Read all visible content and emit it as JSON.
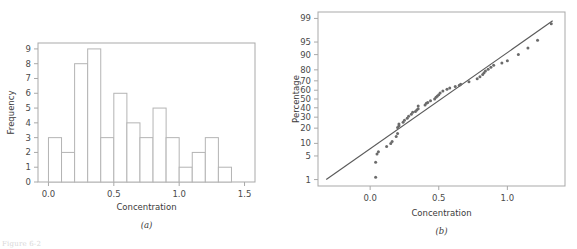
{
  "figure": {
    "background": "#ffffff",
    "ink_color": "#3f3f3f",
    "bar_stroke": "#b4b4b4",
    "line_color": "#5a5a5a",
    "point_color": "#6b6b6b",
    "axis_color": "#a9a9a9",
    "footnote": "Figure 6-2"
  },
  "panel_a": {
    "caption": "(a)",
    "xlabel": "Concentration",
    "ylabel": "Frequency"
  },
  "panel_b": {
    "caption": "(b)",
    "xlabel": "Concentration",
    "ylabel": "Percentage"
  },
  "chart_data": [
    {
      "type": "bar",
      "id": "panel-a-histogram",
      "title": "",
      "subtitle": "",
      "xlabel": "Concentration",
      "ylabel": "Frequency",
      "caption": "(a)",
      "xlim": [
        -0.08,
        1.58
      ],
      "ylim": [
        0,
        9.4
      ],
      "grid": false,
      "legend": null,
      "xticks": [
        0.0,
        0.5,
        1.0,
        1.5
      ],
      "xticklabels": [
        "0.0",
        "0.5",
        "1.0",
        "1.5"
      ],
      "yticks": [
        0,
        1,
        2,
        3,
        4,
        5,
        6,
        7,
        8,
        9
      ],
      "yticklabels": [
        "0",
        "1",
        "2",
        "3",
        "4",
        "5",
        "6",
        "7",
        "8",
        "9"
      ],
      "bin_width": 0.1,
      "bin_edges": [
        0.0,
        0.1,
        0.2,
        0.3,
        0.4,
        0.5,
        0.6,
        0.7,
        0.8,
        0.9,
        1.0,
        1.1,
        1.2,
        1.3
      ],
      "categories": [
        "0.0-0.1",
        "0.1-0.2",
        "0.2-0.3",
        "0.3-0.4",
        "0.4-0.5",
        "0.5-0.6",
        "0.6-0.7",
        "0.7-0.8",
        "0.8-0.9",
        "0.9-1.0",
        "1.0-1.1",
        "1.1-1.2",
        "1.2-1.3"
      ],
      "values": [
        3,
        2,
        8,
        9,
        3,
        6,
        4,
        3,
        5,
        3,
        1,
        2,
        3,
        1
      ],
      "bar_heights": [
        3,
        2,
        8,
        9,
        3,
        6,
        4,
        3,
        5,
        3,
        1,
        2,
        3,
        1
      ]
    },
    {
      "type": "scatter",
      "id": "panel-b-normal-probability-plot",
      "title": "",
      "subtitle": "",
      "xlabel": "Concentration",
      "ylabel": "Percentage",
      "caption": "(b)",
      "xlim": [
        -0.38,
        1.42
      ],
      "xticks": [
        0.0,
        0.5,
        1.0
      ],
      "xticklabels": [
        "0.0",
        "0.5",
        "1.0"
      ],
      "y_scale": "normal-probability",
      "yticks": [
        1,
        5,
        10,
        20,
        30,
        40,
        50,
        60,
        70,
        80,
        90,
        95,
        99
      ],
      "yticklabels": [
        "1",
        "5",
        "10",
        "20",
        "30",
        "40",
        "50",
        "60",
        "70",
        "80",
        "90",
        "95",
        "99"
      ],
      "grid": false,
      "legend": null,
      "reference_line": {
        "label": "normal fit line",
        "x_start": -0.32,
        "y_start": 1.0,
        "x_end": 1.33,
        "y_end": 98.8
      },
      "x": [
        0.04,
        0.04,
        0.05,
        0.06,
        0.12,
        0.15,
        0.16,
        0.19,
        0.2,
        0.2,
        0.21,
        0.21,
        0.24,
        0.25,
        0.27,
        0.28,
        0.3,
        0.31,
        0.33,
        0.34,
        0.35,
        0.35,
        0.4,
        0.41,
        0.42,
        0.44,
        0.47,
        0.48,
        0.49,
        0.5,
        0.51,
        0.53,
        0.56,
        0.58,
        0.62,
        0.65,
        0.66,
        0.72,
        0.78,
        0.8,
        0.82,
        0.83,
        0.84,
        0.86,
        0.88,
        0.9,
        0.96,
        1.0,
        1.08,
        1.15,
        1.22,
        1.32
      ],
      "y": [
        1.2,
        3.4,
        5.6,
        6.4,
        8.5,
        10.0,
        11.0,
        14.0,
        16.0,
        20.5,
        22.0,
        23.5,
        25.0,
        27.0,
        29.0,
        31.0,
        33.0,
        35.0,
        36.0,
        37.5,
        39.0,
        42.0,
        43.0,
        45.0,
        46.0,
        48.0,
        50.0,
        52.0,
        53.5,
        55.0,
        57.0,
        59.0,
        61.0,
        62.5,
        64.0,
        65.5,
        66.5,
        69.0,
        72.0,
        74.0,
        76.0,
        77.5,
        79.0,
        80.5,
        82.0,
        83.5,
        85.0,
        86.5,
        90.0,
        93.0,
        95.5,
        98.5
      ]
    }
  ]
}
